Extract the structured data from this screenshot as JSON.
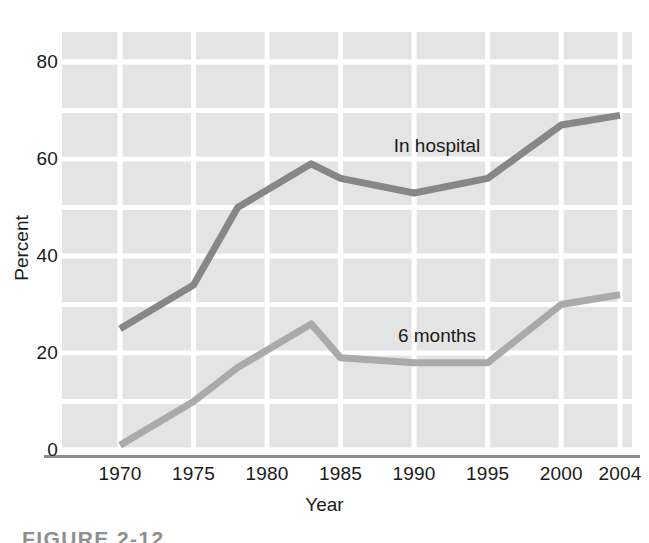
{
  "figure": {
    "caption": "FIGURE 2-12"
  },
  "axes": {
    "y_title": "Percent",
    "x_title": "Year",
    "y_ticks": [
      "0",
      "20",
      "40",
      "60",
      "80"
    ],
    "x_ticks": [
      "1970",
      "1975",
      "1980",
      "1985",
      "1990",
      "1995",
      "2000",
      "2004"
    ]
  },
  "series_labels": {
    "in_hospital": "In hospital",
    "six_months": "6 months"
  },
  "colors": {
    "plot_background": "#e4e4e4",
    "gridline": "#ffffff",
    "axis_line": "#8c8c8c",
    "in_hospital_line": "#878787",
    "six_months_line": "#aaaaaa",
    "text": "#1a1a1a"
  },
  "chart_data": {
    "type": "line",
    "title": "",
    "xlabel": "Year",
    "ylabel": "Percent",
    "xlim": [
      1968,
      2006
    ],
    "ylim": [
      0,
      84
    ],
    "yticks": [
      0,
      20,
      40,
      60,
      80
    ],
    "xticks": [
      1970,
      1975,
      1980,
      1985,
      1990,
      1995,
      2000,
      2004
    ],
    "grid": true,
    "legend": "inline-labels",
    "series": [
      {
        "name": "In hospital",
        "color": "#878787",
        "x": [
          1970,
          1975,
          1978,
          1983,
          1985,
          1990,
          1995,
          2000,
          2004
        ],
        "values": [
          25,
          34,
          50,
          59,
          56,
          53,
          56,
          67,
          69
        ]
      },
      {
        "name": "6 months",
        "color": "#aaaaaa",
        "x": [
          1970,
          1975,
          1978,
          1983,
          1985,
          1990,
          1995,
          2000,
          2004
        ],
        "values": [
          1,
          10,
          17,
          26,
          19,
          18,
          18,
          30,
          32
        ]
      }
    ]
  }
}
